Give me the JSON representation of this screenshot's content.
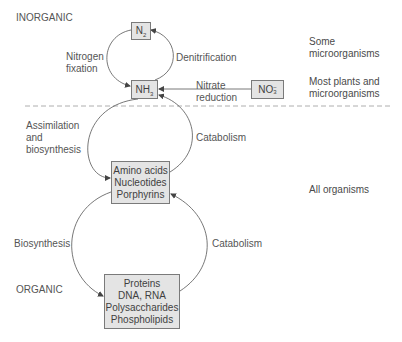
{
  "regions": {
    "inorganic": "INORGANIC",
    "organic": "ORGANIC"
  },
  "boxes": {
    "n2": {
      "base": "N",
      "sub": "2"
    },
    "nh3": {
      "base": "NH",
      "sub": "3"
    },
    "no3": {
      "base": "NO",
      "sub": "3",
      "sup": "−"
    },
    "small_molecules": {
      "lines": [
        "Amino acids",
        "Nucleotides",
        "Porphyrins"
      ]
    },
    "macromolecules": {
      "lines": [
        "Proteins",
        "DNA, RNA",
        "Polysaccharides",
        "Phospholipids"
      ]
    }
  },
  "processes": {
    "nitrogen_fixation": [
      "Nitrogen",
      "fixation"
    ],
    "denitrification": "Denitrification",
    "nitrate_reduction": [
      "Nitrate",
      "reduction"
    ],
    "assimilation": [
      "Assimilation",
      "and",
      "biosynthesis"
    ],
    "catabolism_upper": "Catabolism",
    "biosynthesis": "Biosynthesis",
    "catabolism_lower": "Catabolism"
  },
  "organisms": {
    "some": [
      "Some",
      "microorganisms"
    ],
    "most": [
      "Most plants and",
      "microorganisms"
    ],
    "all": "All organisms"
  },
  "colors": {
    "box_fill": "#e4e4e4",
    "box_border": "#7a7a7a",
    "line": "#555555",
    "dashed": "#9a9a9a"
  }
}
